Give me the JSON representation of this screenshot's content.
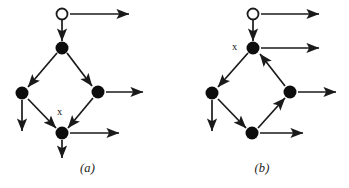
{
  "figure": {
    "background_color": "#ffffff",
    "stroke_color": "#1a1a1a",
    "node_fill_color": "#0d0d0d",
    "open_node_fill_color": "#ffffff",
    "panels": [
      {
        "id": "a",
        "caption": "(a)",
        "marked_node_label": "x",
        "marked_node_label_position": {
          "x": 57,
          "y": 106
        },
        "nodes": [
          {
            "name": "open-source-node",
            "type": "open",
            "cx": 62,
            "cy": 14,
            "r": 5.5
          },
          {
            "name": "top-node",
            "type": "filled",
            "cx": 62,
            "cy": 48,
            "r": 6.5
          },
          {
            "name": "left-node",
            "type": "filled",
            "cx": 22,
            "cy": 93,
            "r": 6.5
          },
          {
            "name": "right-node",
            "type": "filled",
            "cx": 98,
            "cy": 92,
            "r": 6.5
          },
          {
            "name": "bottom-node",
            "type": "filled",
            "cx": 62,
            "cy": 133,
            "r": 6.5
          }
        ],
        "edges": [
          {
            "name": "edge-open-to-top",
            "x1": 62,
            "y1": 20,
            "x2": 62,
            "y2": 41
          },
          {
            "name": "edge-top-to-left",
            "x1": 57,
            "y1": 53,
            "x2": 28,
            "y2": 87
          },
          {
            "name": "edge-top-to-right",
            "x1": 67,
            "y1": 53,
            "x2": 92,
            "y2": 86
          },
          {
            "name": "edge-left-to-bottom",
            "x1": 28,
            "y1": 99,
            "x2": 56,
            "y2": 128
          },
          {
            "name": "edge-right-to-bottom",
            "x1": 93,
            "y1": 98,
            "x2": 68,
            "y2": 128
          },
          {
            "name": "edge-open-outgoing",
            "x1": 70,
            "y1": 14,
            "x2": 129,
            "y2": 14
          },
          {
            "name": "edge-left-outgoing",
            "x1": 22,
            "y1": 100,
            "x2": 22,
            "y2": 131
          },
          {
            "name": "edge-right-outgoing",
            "x1": 106,
            "y1": 92,
            "x2": 143,
            "y2": 92
          },
          {
            "name": "edge-bottom-outgoing-right",
            "x1": 70,
            "y1": 133,
            "x2": 119,
            "y2": 133
          },
          {
            "name": "edge-bottom-outgoing-down",
            "x1": 62,
            "y1": 140,
            "x2": 62,
            "y2": 158
          }
        ]
      },
      {
        "id": "b",
        "caption": "(b)",
        "marked_node_label": "x",
        "marked_node_label_position": {
          "x": 57,
          "y": 41
        },
        "nodes": [
          {
            "name": "open-source-node",
            "type": "open",
            "cx": 78,
            "cy": 14,
            "r": 5.5
          },
          {
            "name": "top-node",
            "type": "filled",
            "cx": 78,
            "cy": 48,
            "r": 6.5
          },
          {
            "name": "left-node",
            "type": "filled",
            "cx": 37,
            "cy": 93,
            "r": 6.5
          },
          {
            "name": "right-node",
            "type": "filled",
            "cx": 115,
            "cy": 92,
            "r": 6.5
          },
          {
            "name": "bottom-node",
            "type": "filled",
            "cx": 77,
            "cy": 133,
            "r": 6.5
          }
        ],
        "edges": [
          {
            "name": "edge-open-to-top",
            "x1": 78,
            "y1": 20,
            "x2": 78,
            "y2": 41
          },
          {
            "name": "edge-top-to-left",
            "x1": 73,
            "y1": 53,
            "x2": 43,
            "y2": 87
          },
          {
            "name": "edge-right-to-top",
            "x1": 110,
            "y1": 86,
            "x2": 85,
            "y2": 54
          },
          {
            "name": "edge-left-to-bottom",
            "x1": 43,
            "y1": 99,
            "x2": 71,
            "y2": 128
          },
          {
            "name": "edge-bottom-to-right",
            "x1": 83,
            "y1": 128,
            "x2": 110,
            "y2": 98
          },
          {
            "name": "edge-open-outgoing",
            "x1": 86,
            "y1": 14,
            "x2": 144,
            "y2": 14
          },
          {
            "name": "edge-top-outgoing",
            "x1": 86,
            "y1": 48,
            "x2": 144,
            "y2": 48
          },
          {
            "name": "edge-left-outgoing",
            "x1": 37,
            "y1": 100,
            "x2": 37,
            "y2": 131
          },
          {
            "name": "edge-right-outgoing",
            "x1": 123,
            "y1": 92,
            "x2": 161,
            "y2": 92
          },
          {
            "name": "edge-bottom-outgoing",
            "x1": 85,
            "y1": 133,
            "x2": 128,
            "y2": 133
          }
        ]
      }
    ]
  }
}
